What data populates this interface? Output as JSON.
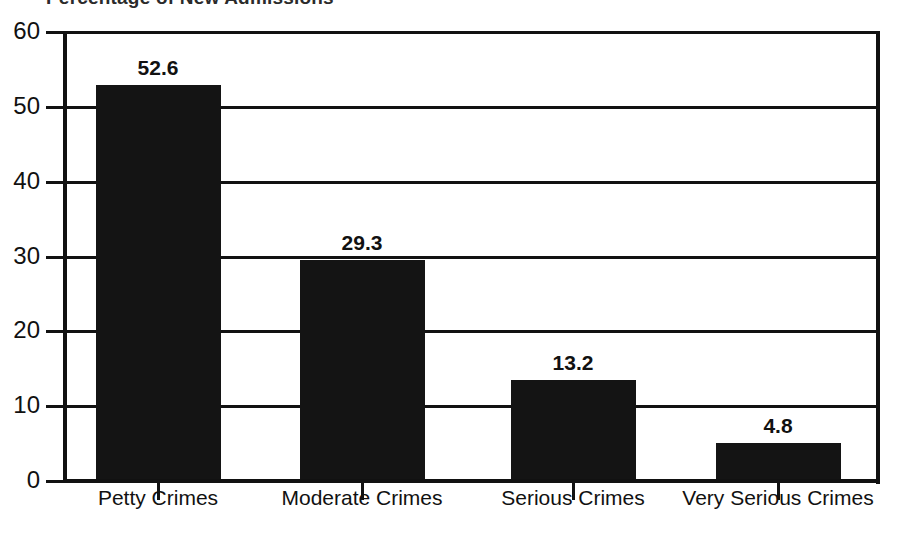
{
  "chart_data": {
    "type": "bar",
    "title": "Percentage of New Admissions",
    "xlabel": "",
    "ylabel": "",
    "categories": [
      "Petty Crimes",
      "Moderate Crimes",
      "Serious Crimes",
      "Very Serious Crimes"
    ],
    "values": [
      52.6,
      29.3,
      13.2,
      4.8
    ],
    "value_labels": [
      "52.6",
      "29.3",
      "13.2",
      "4.8"
    ],
    "ylim": [
      0,
      60
    ],
    "yticks": [
      60,
      50,
      40,
      30,
      20,
      10,
      0
    ],
    "ytick_labels": [
      "60",
      "50",
      "40",
      "30",
      "20",
      "10",
      "0"
    ],
    "grid": "horizontal",
    "legend": "none",
    "bar_color": "#141414",
    "axis_color": "#111111",
    "background_color": "#ffffff"
  }
}
